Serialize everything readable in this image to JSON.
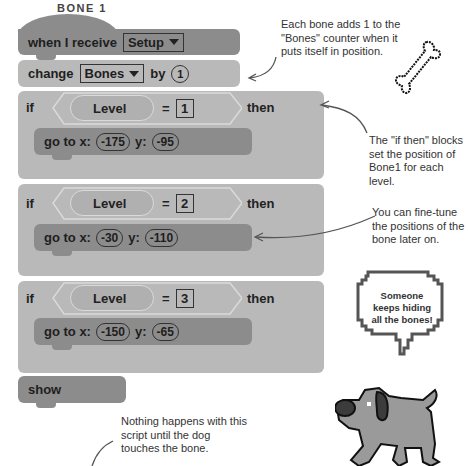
{
  "title": "BONE 1",
  "blocks": {
    "when_receive": {
      "label": "when I receive",
      "message": "Setup"
    },
    "change": {
      "label": "change",
      "variable": "Bones",
      "by": "by",
      "value": "1"
    },
    "if_blocks": [
      {
        "if": "if",
        "variable": "Level",
        "operator": "=",
        "value": "1",
        "then": "then",
        "goto": {
          "label": "go to x:",
          "x": "-175",
          "ylabel": "y:",
          "y": "-95"
        }
      },
      {
        "if": "if",
        "variable": "Level",
        "operator": "=",
        "value": "2",
        "then": "then",
        "goto": {
          "label": "go to x:",
          "x": "-30",
          "ylabel": "y:",
          "y": "-110"
        }
      },
      {
        "if": "if",
        "variable": "Level",
        "operator": "=",
        "value": "3",
        "then": "then",
        "goto": {
          "label": "go to x:",
          "x": "-150",
          "ylabel": "y:",
          "y": "-65"
        }
      }
    ],
    "show": {
      "label": "show"
    }
  },
  "annotations": {
    "bones_counter": "Each bone adds 1 to the \"Bones\" counter when it puts itself in position.",
    "if_then": "The \"if then\" blocks set the position of Bone1 for each level.",
    "fine_tune": "You can fine-tune the positions of the bone later on.",
    "nothing_happens": "Nothing happens with this script until the dog touches the bone."
  },
  "speech_bubble": "Someone keeps hiding all the bones!",
  "colors": {
    "dark_block": "#8c8c8c",
    "light_block": "#b9b9b9",
    "text": "#1e1e1e"
  }
}
